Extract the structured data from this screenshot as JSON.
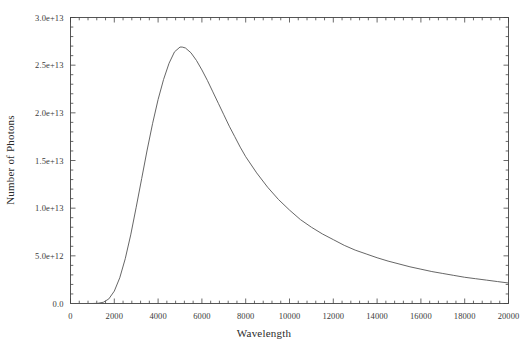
{
  "chart_data": {
    "type": "line",
    "title": "",
    "xlabel": "Wavelength",
    "ylabel": "Number of Photons",
    "xlim": [
      0,
      20000
    ],
    "ylim": [
      0,
      30000000000000
    ],
    "grid": false,
    "legend": null,
    "xticks": [
      0,
      2000,
      4000,
      6000,
      8000,
      10000,
      12000,
      14000,
      16000,
      18000,
      20000
    ],
    "xticklabels": [
      "0",
      "2000",
      "4000",
      "6000",
      "8000",
      "10000",
      "12000",
      "14000",
      "16000",
      "18000",
      "20000"
    ],
    "yticks": [
      0,
      5000000000000,
      10000000000000,
      15000000000000,
      20000000000000,
      25000000000000,
      30000000000000
    ],
    "yticklabels": [
      "0.0",
      "5.0e+12",
      "1.0e+13",
      "1.5e+13",
      "2.0e+13",
      "2.5e+13",
      "3.0e+13"
    ],
    "series": [
      {
        "name": "Photon spectral distribution",
        "color": "#555555",
        "x": [
          0,
          250,
          500,
          750,
          1000,
          1250,
          1500,
          1750,
          2000,
          2250,
          2500,
          2750,
          3000,
          3250,
          3500,
          3750,
          4000,
          4250,
          4500,
          4750,
          5000,
          5100,
          5250,
          5500,
          5750,
          6000,
          6250,
          6500,
          6750,
          7000,
          7250,
          7500,
          7750,
          8000,
          8500,
          9000,
          9500,
          10000,
          10500,
          11000,
          11500,
          12000,
          12500,
          13000,
          13500,
          14000,
          14500,
          15000,
          15500,
          16000,
          16500,
          17000,
          17500,
          18000,
          18500,
          19000,
          19500,
          20000
        ],
        "y": [
          0,
          0,
          0,
          0,
          2000000000,
          20000000000,
          130000000000,
          480000000000,
          1300000000000,
          2700000000000,
          4700000000000,
          7200000000000,
          10100000000000,
          13100000000000,
          16100000000000,
          18900000000000,
          21400000000000,
          23500000000000,
          25200000000000,
          26400000000000,
          26900000000000,
          26900000000000,
          26800000000000,
          26300000000000,
          25500000000000,
          24500000000000,
          23400000000000,
          22200000000000,
          21000000000000,
          19800000000000,
          18600000000000,
          17500000000000,
          16400000000000,
          15400000000000,
          13700000000000,
          12200000000000,
          10900000000000,
          9800000000000,
          8800000000000,
          8000000000000,
          7300000000000,
          6700000000000,
          6100000000000,
          5600000000000,
          5200000000000,
          4800000000000,
          4450000000000,
          4150000000000,
          3850000000000,
          3600000000000,
          3350000000000,
          3150000000000,
          2950000000000,
          2750000000000,
          2600000000000,
          2450000000000,
          2300000000000,
          2150000000000
        ]
      }
    ],
    "annotations": {
      "peak_x": 5068,
      "peak_y": 26900000000000
    },
    "style": {
      "frame_color": "#444444",
      "tick_color": "#444444",
      "background": "#ffffff"
    }
  }
}
